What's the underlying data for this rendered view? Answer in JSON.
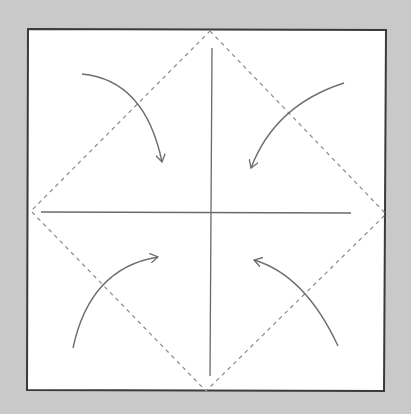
{
  "diagram": {
    "colors": {
      "background": "#c9c9c9",
      "paper": "#ffffff",
      "edge": "#3a3a3a",
      "crease": "#6a6a6a",
      "dashed": "#8a8a8a",
      "arrow": "#6e6e6e"
    },
    "paper_square": {
      "corners": [
        [
          28,
          29
        ],
        [
          386,
          30
        ],
        [
          384,
          391
        ],
        [
          27,
          390
        ]
      ]
    },
    "creases": [
      {
        "id": "vertical",
        "from": [
          212,
          48
        ],
        "to": [
          210,
          376
        ]
      },
      {
        "id": "horizontal",
        "from": [
          41,
          212
        ],
        "to": [
          351,
          213
        ]
      }
    ],
    "fold_diamond": {
      "vertices": [
        [
          210,
          31
        ],
        [
          386,
          214
        ],
        [
          206,
          391
        ],
        [
          31,
          211
        ]
      ],
      "style": "dashed"
    },
    "arrows": [
      {
        "id": "top-left",
        "direction": "fold corner to center"
      },
      {
        "id": "top-right",
        "direction": "fold corner to center"
      },
      {
        "id": "bottom-left",
        "direction": "fold corner to center"
      },
      {
        "id": "bottom-right",
        "direction": "fold corner to center"
      }
    ]
  }
}
